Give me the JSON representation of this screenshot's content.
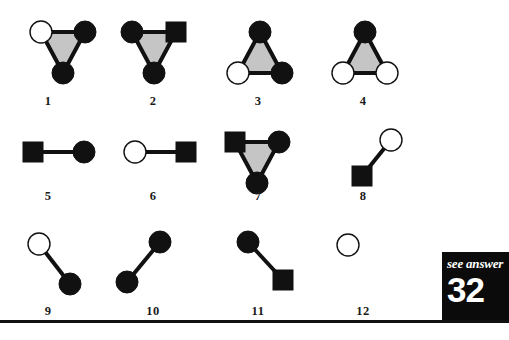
{
  "page": {
    "width": 509,
    "height": 340,
    "background": "#ffffff",
    "ink": "#111111",
    "fill_gray": "#c5c5c5"
  },
  "answer_box": {
    "see_answer_label": "see answer",
    "answer_number": "32",
    "background": "#0b0b0b",
    "text_color": "#ffffff"
  },
  "puzzle": {
    "node_colors": {
      "black": "#111111",
      "white": "#ffffff",
      "outline": "#111111"
    },
    "figures": [
      {
        "label": "1",
        "type": "triangle",
        "label_x": 48,
        "label_y": 95,
        "origin_x": 22,
        "origin_y": 16,
        "triangle_fill": "#c5c5c5",
        "nodes": [
          {
            "name": "top-left",
            "shape": "circle",
            "fill": "white",
            "cx": 19,
            "cy": 16
          },
          {
            "name": "top-right",
            "shape": "circle",
            "fill": "black",
            "cx": 63,
            "cy": 16
          },
          {
            "name": "bottom",
            "shape": "circle",
            "fill": "black",
            "cx": 41,
            "cy": 57
          }
        ]
      },
      {
        "label": "2",
        "type": "triangle",
        "label_x": 153,
        "label_y": 95,
        "origin_x": 113,
        "origin_y": 16,
        "triangle_fill": "#c5c5c5",
        "nodes": [
          {
            "name": "top-left",
            "shape": "circle",
            "fill": "black",
            "cx": 19,
            "cy": 16
          },
          {
            "name": "top-right",
            "shape": "square",
            "fill": "black",
            "cx": 63,
            "cy": 16
          },
          {
            "name": "bottom",
            "shape": "circle",
            "fill": "black",
            "cx": 41,
            "cy": 57
          }
        ]
      },
      {
        "label": "3",
        "type": "triangle",
        "label_x": 258,
        "label_y": 95,
        "origin_x": 219,
        "origin_y": 16,
        "triangle_fill": "#c5c5c5",
        "nodes": [
          {
            "name": "top",
            "shape": "circle",
            "fill": "black",
            "cx": 41,
            "cy": 16
          },
          {
            "name": "bottom-left",
            "shape": "circle",
            "fill": "white",
            "cx": 19,
            "cy": 57
          },
          {
            "name": "bottom-right",
            "shape": "circle",
            "fill": "black",
            "cx": 63,
            "cy": 57
          }
        ]
      },
      {
        "label": "4",
        "type": "triangle",
        "label_x": 363,
        "label_y": 95,
        "origin_x": 324,
        "origin_y": 16,
        "triangle_fill": "#c5c5c5",
        "nodes": [
          {
            "name": "top",
            "shape": "circle",
            "fill": "black",
            "cx": 41,
            "cy": 16
          },
          {
            "name": "bottom-left",
            "shape": "circle",
            "fill": "white",
            "cx": 19,
            "cy": 57
          },
          {
            "name": "bottom-right",
            "shape": "circle",
            "fill": "white",
            "cx": 63,
            "cy": 57
          }
        ]
      },
      {
        "label": "5",
        "type": "edge",
        "label_x": 48,
        "label_y": 190,
        "origin_x": 22,
        "origin_y": 136,
        "nodes": [
          {
            "name": "left",
            "shape": "square",
            "fill": "black",
            "cx": 11,
            "cy": 16
          },
          {
            "name": "right",
            "shape": "circle",
            "fill": "black",
            "cx": 62,
            "cy": 16
          }
        ]
      },
      {
        "label": "6",
        "type": "edge",
        "label_x": 153,
        "label_y": 190,
        "origin_x": 124,
        "origin_y": 136,
        "nodes": [
          {
            "name": "left",
            "shape": "circle",
            "fill": "white",
            "cx": 11,
            "cy": 16
          },
          {
            "name": "right",
            "shape": "square",
            "fill": "black",
            "cx": 62,
            "cy": 16
          }
        ]
      },
      {
        "label": "7",
        "type": "triangle",
        "label_x": 258,
        "label_y": 190,
        "origin_x": 216,
        "origin_y": 126,
        "triangle_fill": "#c5c5c5",
        "nodes": [
          {
            "name": "top-left",
            "shape": "square",
            "fill": "black",
            "cx": 19,
            "cy": 16
          },
          {
            "name": "top-right",
            "shape": "circle",
            "fill": "black",
            "cx": 63,
            "cy": 16
          },
          {
            "name": "bottom",
            "shape": "circle",
            "fill": "black",
            "cx": 41,
            "cy": 57
          }
        ]
      },
      {
        "label": "8",
        "type": "edge",
        "label_x": 363,
        "label_y": 190,
        "origin_x": 345,
        "origin_y": 128,
        "nodes": [
          {
            "name": "top-right",
            "shape": "circle",
            "fill": "white",
            "cx": 46,
            "cy": 12
          },
          {
            "name": "bottom-left",
            "shape": "square",
            "fill": "black",
            "cx": 17,
            "cy": 48
          }
        ]
      },
      {
        "label": "9",
        "type": "edge",
        "label_x": 48,
        "label_y": 305,
        "origin_x": 22,
        "origin_y": 232,
        "nodes": [
          {
            "name": "top-left",
            "shape": "circle",
            "fill": "white",
            "cx": 17,
            "cy": 12
          },
          {
            "name": "bottom-right",
            "shape": "circle",
            "fill": "black",
            "cx": 48,
            "cy": 52
          }
        ]
      },
      {
        "label": "10",
        "type": "edge",
        "label_x": 153,
        "label_y": 305,
        "origin_x": 108,
        "origin_y": 230,
        "nodes": [
          {
            "name": "top-right",
            "shape": "circle",
            "fill": "black",
            "cx": 52,
            "cy": 12
          },
          {
            "name": "bottom-left",
            "shape": "circle",
            "fill": "black",
            "cx": 19,
            "cy": 52
          }
        ]
      },
      {
        "label": "11",
        "type": "edge",
        "label_x": 258,
        "label_y": 305,
        "origin_x": 230,
        "origin_y": 230,
        "nodes": [
          {
            "name": "top-left",
            "shape": "circle",
            "fill": "black",
            "cx": 18,
            "cy": 12
          },
          {
            "name": "bottom-right",
            "shape": "square",
            "fill": "black",
            "cx": 53,
            "cy": 50
          }
        ]
      },
      {
        "label": "12",
        "type": "single",
        "label_x": 363,
        "label_y": 305,
        "origin_x": 330,
        "origin_y": 232,
        "nodes": [
          {
            "name": "only",
            "shape": "circle",
            "fill": "white",
            "cx": 18,
            "cy": 13
          }
        ]
      }
    ]
  }
}
